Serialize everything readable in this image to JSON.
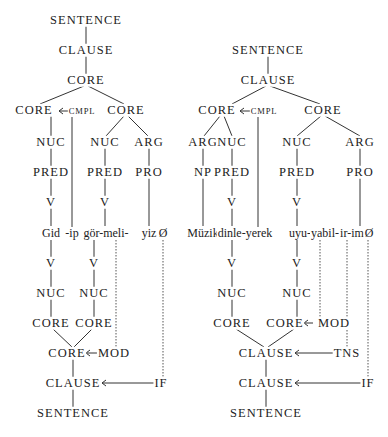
{
  "diagram": {
    "colors": {
      "text": "#222222",
      "line": "#333333",
      "background": "#ffffff"
    },
    "left_tree": {
      "nodes": {
        "sentence_top": "SENTENCE",
        "clause_top": "CLAUSE",
        "core_top": "CORE",
        "core_a": "CORE",
        "cmpl": "CMPL",
        "core_b": "CORE",
        "nuc_a": "NUC",
        "nuc_b": "NUC",
        "arg_b": "ARG",
        "pred_a": "PRED",
        "pred_b": "PRED",
        "pro_b": "PRO",
        "v_a": "V",
        "v_b": "V",
        "v_a_low": "V",
        "v_b_low": "V",
        "nuc_a_low": "NUC",
        "nuc_b_low": "NUC",
        "core_a_low": "CORE",
        "core_b_low": "CORE",
        "core_join": "CORE",
        "mod": "MOD",
        "clause_bottom": "CLAUSE",
        "if": "IF",
        "sentence_bottom": "SENTENCE"
      },
      "words": [
        "Gid",
        "-ip",
        "gör-meli-",
        "yiz",
        "Ø"
      ]
    },
    "right_tree": {
      "nodes": {
        "sentence_top": "SENTENCE",
        "clause_top": "CLAUSE",
        "core_a": "CORE",
        "cmpl": "CMPL",
        "core_b": "CORE",
        "arg_a": "ARG",
        "nuc_a": "NUC",
        "nuc_b": "NUC",
        "arg_b": "ARG",
        "np_a": "NP",
        "pred_a": "PRED",
        "pred_b": "PRED",
        "pro_b": "PRO",
        "v_a": "V",
        "v_b": "V",
        "v_a_low": "V",
        "v_b_low": "V",
        "nuc_a_low": "NUC",
        "nuc_b_low": "NUC",
        "core_a_low": "CORE",
        "core_b_low": "CORE",
        "mod": "MOD",
        "clause_join": "CLAUSE",
        "tns": "TNS",
        "clause_bottom": "CLAUSE",
        "if": "IF",
        "sentence_bottom": "SENTENCE"
      },
      "words": [
        "Müzik",
        "dinle-yerek",
        "uyu-",
        "yabil-",
        "ir-im",
        "Ø"
      ]
    }
  }
}
